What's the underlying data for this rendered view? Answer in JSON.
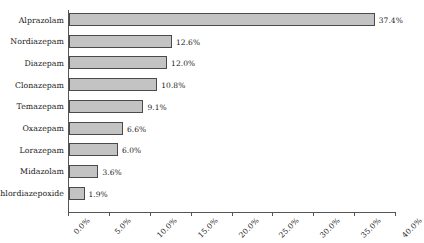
{
  "chart_data": {
    "type": "bar",
    "orientation": "horizontal",
    "title": "",
    "subtitle": "",
    "xlabel": "",
    "ylabel": "",
    "categories": [
      "Alprazolam",
      "Nordiazepam",
      "Diazepam",
      "Clonazepam",
      "Temazepam",
      "Oxazepam",
      "Lorazepam",
      "Midazolam",
      "Chlordiazepoxide"
    ],
    "values": [
      37.4,
      12.6,
      12.0,
      10.8,
      9.1,
      6.6,
      6.0,
      3.6,
      1.9
    ],
    "data_labels": [
      "37.4%",
      "12.6%",
      "12.0%",
      "10.8%",
      "9.1%",
      "6.6%",
      "6.0%",
      "3.6%",
      "1.9%"
    ],
    "xlim": [
      0,
      40
    ],
    "xticks": [
      0,
      5,
      10,
      15,
      20,
      25,
      30,
      35,
      40
    ],
    "xtick_labels": [
      "0.0%",
      "5.0%",
      "10.0%",
      "15.0%",
      "20.0%",
      "25.0%",
      "30.0%",
      "35.0%",
      "40.0%"
    ],
    "grid": false,
    "legend": false,
    "bar_fill_color": "#c3c3c3",
    "bar_border_color": "#4a4a4a",
    "axis_color": "#555555",
    "background_color": "#ffffff"
  }
}
